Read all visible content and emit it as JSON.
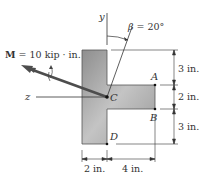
{
  "diagram": {
    "type": "T-section beam cross-section under bending moment",
    "moment": {
      "symbol": "M",
      "label_rest": " = 10 kip · in.",
      "value": 10,
      "units": "kip · in."
    },
    "angle": {
      "label": "β = 20°",
      "value_deg": 20
    },
    "axes": {
      "y": "y",
      "z": "z"
    },
    "points": {
      "A": "A",
      "B": "B",
      "C": "C",
      "D": "D"
    },
    "dimensions": {
      "top": "3 in.",
      "middle": "2 in.",
      "bottom": "3 in.",
      "flange_width": "2 in.",
      "web_length": "4 in."
    },
    "colors": {
      "section_fill": "#a9a9a9",
      "section_edge": "#555555",
      "arrow": "#4d4d4d",
      "lines": "#333333"
    }
  }
}
